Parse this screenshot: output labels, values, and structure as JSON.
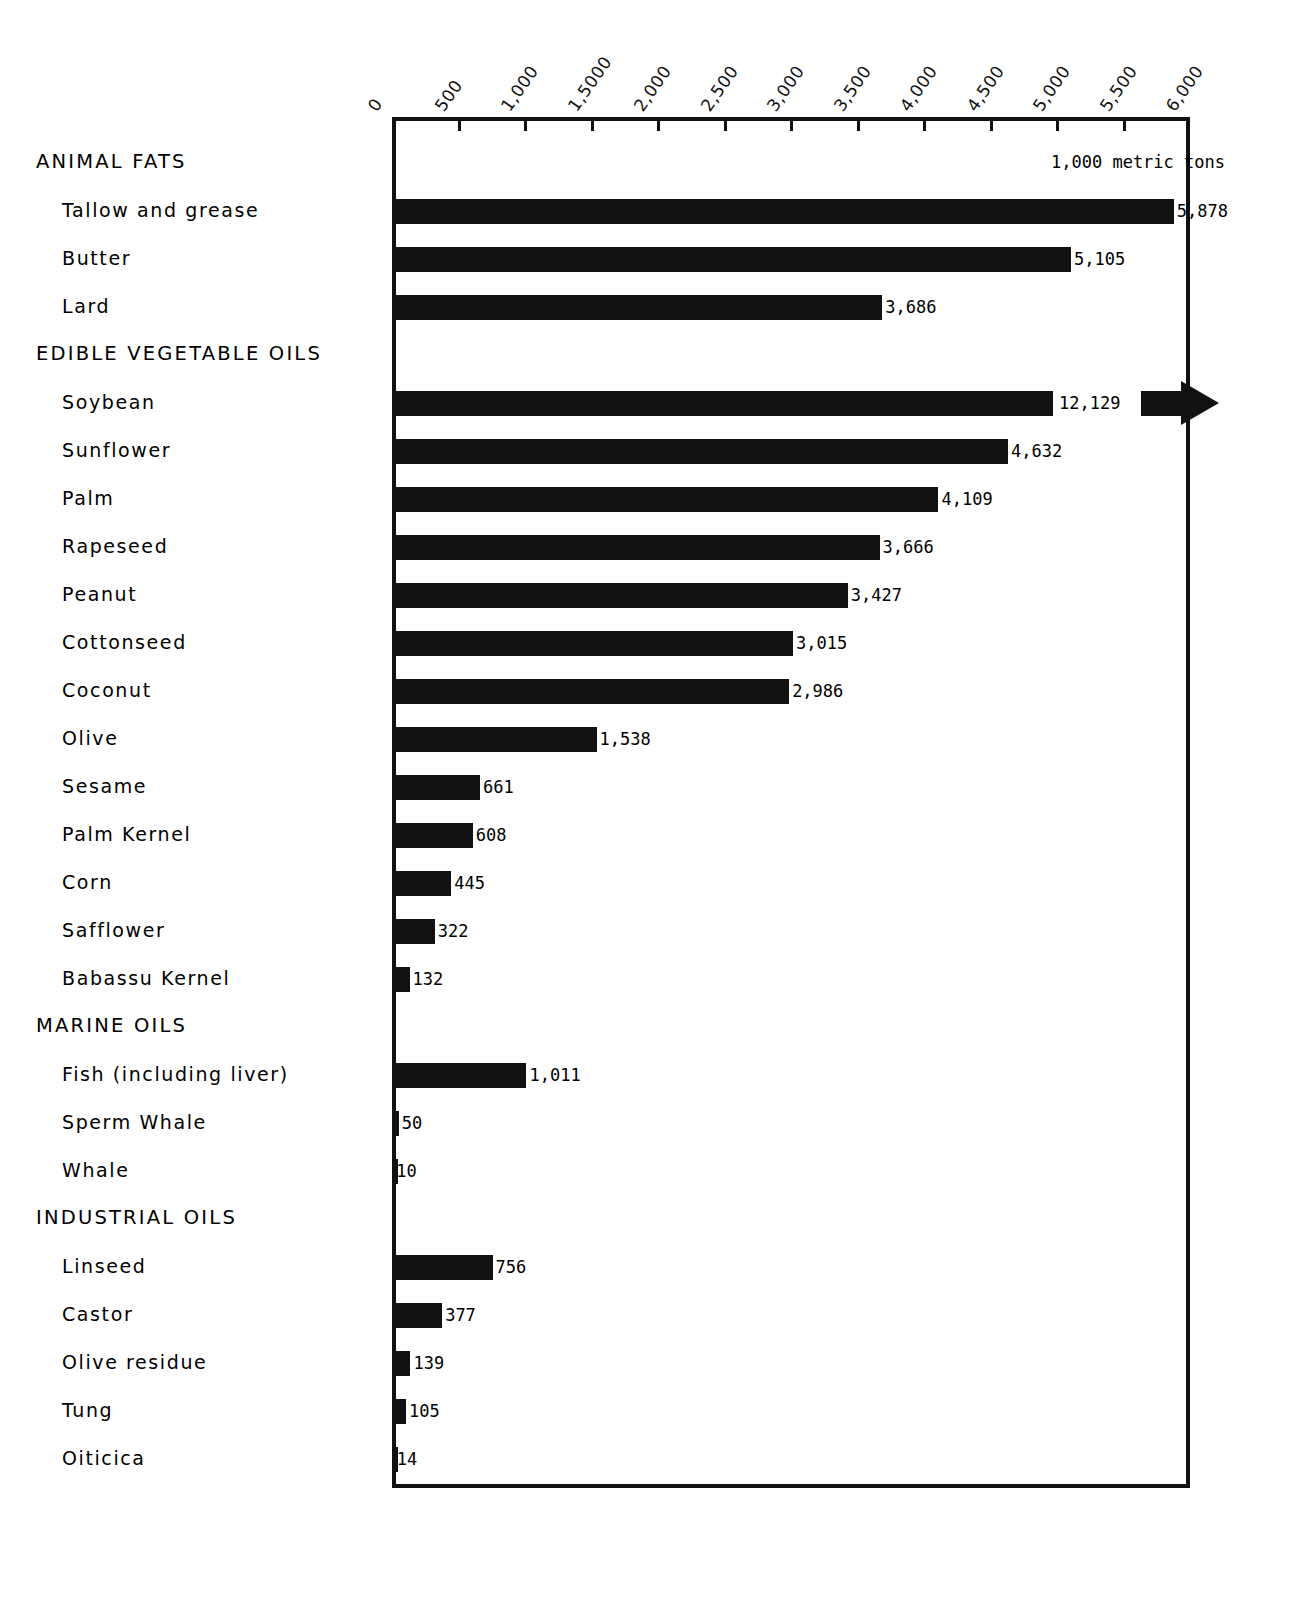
{
  "chart_data": {
    "type": "bar",
    "orientation": "horizontal",
    "title": "",
    "xlabel": "",
    "ylabel": "",
    "units_note": "1,000 metric tons",
    "xlim": [
      0,
      6000
    ],
    "grid": false,
    "legend": "none",
    "axis_ticks": [
      "0",
      "500",
      "1,000",
      "1,5000",
      "2,000",
      "2,500",
      "3,000",
      "3,500",
      "4,000",
      "4,500",
      "5,000",
      "5,500",
      "6,000"
    ],
    "axis_tick_values": [
      0,
      500,
      1000,
      1500,
      2000,
      2500,
      3000,
      3500,
      4000,
      4500,
      5000,
      5500,
      6000
    ],
    "categories": [
      "Tallow and grease",
      "Butter",
      "Lard",
      "Soybean",
      "Sunflower",
      "Palm",
      "Rapeseed",
      "Peanut",
      "Cottonseed",
      "Coconut",
      "Olive",
      "Sesame",
      "Palm Kernel",
      "Corn",
      "Safflower",
      "Babassu Kernel",
      "Fish (including liver)",
      "Sperm Whale",
      "Whale",
      "Linseed",
      "Castor",
      "Olive residue",
      "Tung",
      "Oiticica"
    ],
    "values": [
      5878,
      5105,
      3686,
      12129,
      4632,
      4109,
      3666,
      3427,
      3015,
      2986,
      1538,
      661,
      608,
      445,
      322,
      132,
      1011,
      50,
      10,
      756,
      377,
      139,
      105,
      14
    ],
    "section_headers": [
      "ANIMAL FATS",
      "EDIBLE VEGETABLE OILS",
      "MARINE OILS",
      "INDUSTRIAL OILS"
    ],
    "rows": [
      {
        "kind": "section",
        "label": "ANIMAL FATS"
      },
      {
        "kind": "item",
        "label": "Tallow and grease",
        "value": 5878,
        "value_text": "5,878"
      },
      {
        "kind": "item",
        "label": "Butter",
        "value": 5105,
        "value_text": "5,105"
      },
      {
        "kind": "item",
        "label": "Lard",
        "value": 3686,
        "value_text": "3,686"
      },
      {
        "kind": "section",
        "label": "EDIBLE VEGETABLE OILS"
      },
      {
        "kind": "item",
        "label": "Soybean",
        "value": 12129,
        "value_text": "12,129",
        "overflow": true
      },
      {
        "kind": "item",
        "label": "Sunflower",
        "value": 4632,
        "value_text": "4,632"
      },
      {
        "kind": "item",
        "label": "Palm",
        "value": 4109,
        "value_text": "4,109"
      },
      {
        "kind": "item",
        "label": "Rapeseed",
        "value": 3666,
        "value_text": "3,666"
      },
      {
        "kind": "item",
        "label": "Peanut",
        "value": 3427,
        "value_text": "3,427"
      },
      {
        "kind": "item",
        "label": "Cottonseed",
        "value": 3015,
        "value_text": "3,015"
      },
      {
        "kind": "item",
        "label": "Coconut",
        "value": 2986,
        "value_text": "2,986"
      },
      {
        "kind": "item",
        "label": "Olive",
        "value": 1538,
        "value_text": "1,538"
      },
      {
        "kind": "item",
        "label": "Sesame",
        "value": 661,
        "value_text": "661"
      },
      {
        "kind": "item",
        "label": "Palm Kernel",
        "value": 608,
        "value_text": "608"
      },
      {
        "kind": "item",
        "label": "Corn",
        "value": 445,
        "value_text": "445"
      },
      {
        "kind": "item",
        "label": "Safflower",
        "value": 322,
        "value_text": "322"
      },
      {
        "kind": "item",
        "label": "Babassu Kernel",
        "value": 132,
        "value_text": "132"
      },
      {
        "kind": "section",
        "label": "MARINE OILS"
      },
      {
        "kind": "item",
        "label": "Fish (including liver)",
        "value": 1011,
        "value_text": "1,011"
      },
      {
        "kind": "item",
        "label": "Sperm Whale",
        "value": 50,
        "value_text": "50"
      },
      {
        "kind": "item",
        "label": "Whale",
        "value": 10,
        "value_text": "10"
      },
      {
        "kind": "section",
        "label": "INDUSTRIAL OILS"
      },
      {
        "kind": "item",
        "label": "Linseed",
        "value": 756,
        "value_text": "756"
      },
      {
        "kind": "item",
        "label": "Castor",
        "value": 377,
        "value_text": "377"
      },
      {
        "kind": "item",
        "label": "Olive residue",
        "value": 139,
        "value_text": "139"
      },
      {
        "kind": "item",
        "label": "Tung",
        "value": 105,
        "value_text": "105"
      },
      {
        "kind": "item",
        "label": "Oiticica",
        "value": 14,
        "value_text": "14"
      }
    ],
    "colors": {
      "bar": "#111111",
      "axis": "#111111",
      "text": "#000000",
      "background": "#ffffff"
    }
  }
}
